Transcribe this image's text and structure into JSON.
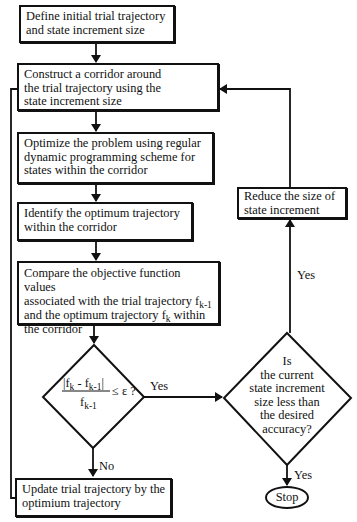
{
  "diagram": {
    "type": "flowchart",
    "nodes": {
      "define": {
        "shape": "box",
        "line1": "Define initial trial trajectory",
        "line2": "and state increment size"
      },
      "construct": {
        "shape": "box",
        "line1": "Construct a corridor around",
        "line2": "the trial trajectory using the",
        "line3": "state increment size"
      },
      "optimize": {
        "shape": "box",
        "line1": "Optimize the problem using regular",
        "line2": "dynamic programming scheme for",
        "line3": "states within the corridor"
      },
      "identify": {
        "shape": "box",
        "line1": "Identify the optimum trajectory",
        "line2": "within the corridor"
      },
      "compare": {
        "shape": "box",
        "line1": "Compare the objective function values",
        "line2a": "associated with the trial trajectory f",
        "line2sub": "k-1",
        "line3a": "and the optimum trajectory f",
        "line3sub": "k",
        "line3b": " within",
        "line4": "the corridor"
      },
      "convergence": {
        "shape": "diamond",
        "num_a": "|f",
        "num_sub1": "k",
        "num_b": " - f",
        "num_sub2": "k-1",
        "num_c": "|",
        "den_a": "f",
        "den_sub": "k-1",
        "rhs": "≤ ε ?"
      },
      "update": {
        "shape": "box",
        "line1": "Update trial trajectory by the",
        "line2": "optimium trajectory"
      },
      "accuracy": {
        "shape": "diamond",
        "line1": "Is",
        "line2": "the current",
        "line3": "state increment",
        "line4": "size less than",
        "line5": "the desired",
        "line6": "accuracy?"
      },
      "reduce": {
        "shape": "box",
        "line1": "Reduce the size of",
        "line2": "state increment"
      },
      "stop": {
        "shape": "ellipse",
        "label": "Stop"
      }
    },
    "edge_labels": {
      "convergence_yes": "Yes",
      "convergence_no": "No",
      "accuracy_no_up": "Yes",
      "accuracy_yes_down": "Yes"
    },
    "edges": [
      {
        "from": "define",
        "to": "construct"
      },
      {
        "from": "construct",
        "to": "optimize"
      },
      {
        "from": "optimize",
        "to": "identify"
      },
      {
        "from": "identify",
        "to": "compare"
      },
      {
        "from": "compare",
        "to": "convergence"
      },
      {
        "from": "convergence",
        "to": "accuracy",
        "label": "Yes"
      },
      {
        "from": "convergence",
        "to": "update",
        "label": "No"
      },
      {
        "from": "update",
        "to": "construct"
      },
      {
        "from": "accuracy",
        "to": "reduce",
        "label": "Yes"
      },
      {
        "from": "reduce",
        "to": "construct"
      },
      {
        "from": "accuracy",
        "to": "stop",
        "label": "Yes"
      }
    ],
    "colors": {
      "stroke": "#111111",
      "background": "#ffffff"
    }
  }
}
